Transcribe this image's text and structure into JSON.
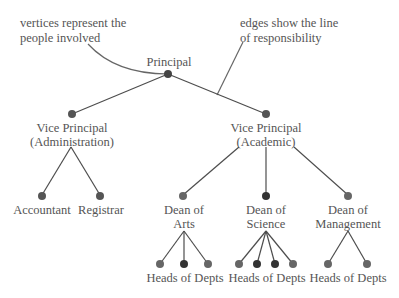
{
  "annotations": {
    "vertices_note": [
      "vertices represent the",
      "people involved"
    ],
    "edges_note": [
      "edges show the line",
      "of responsibility"
    ]
  },
  "nodes": {
    "principal": {
      "label": "Principal"
    },
    "vp_admin": {
      "label1": "Vice Principal",
      "label2": "(Administration)"
    },
    "vp_academic": {
      "label1": "Vice Principal",
      "label2": "(Academic)"
    },
    "accountant": {
      "label": "Accountant"
    },
    "registrar": {
      "label": "Registrar"
    },
    "dean_arts": {
      "label1": "Dean of",
      "label2": "Arts"
    },
    "dean_science": {
      "label1": "Dean of",
      "label2": "Science"
    },
    "dean_management": {
      "label1": "Dean of",
      "label2": "Management"
    },
    "heads_arts": {
      "label": "Heads of Depts"
    },
    "heads_science": {
      "label": "Heads of Depts"
    },
    "heads_management": {
      "label": "Heads of Depts"
    }
  },
  "colors": {
    "edge": "#4d4d4d",
    "node": "#555555",
    "node_dark": "#333333",
    "text": "#555555"
  }
}
